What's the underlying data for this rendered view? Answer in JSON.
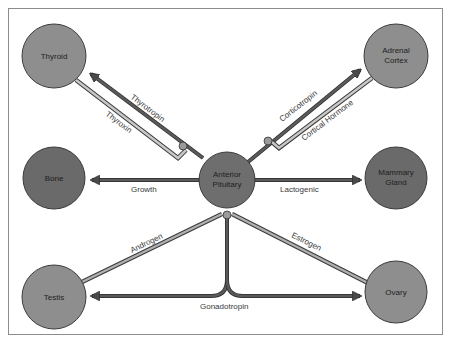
{
  "diagram": {
    "colors": {
      "frame": "#8c8c8c",
      "node_light": "#8e8e8e",
      "node_dark": "#6a6a6a",
      "node_stroke": "#3c3c3c",
      "arrow_dark": "#4a4a4a",
      "arrow_light": "#9a9a9a"
    },
    "nodes": {
      "center": {
        "line1": "Anterior",
        "line2": "Pituitary"
      },
      "thyroid": {
        "line1": "Thyroid"
      },
      "adrenal": {
        "line1": "Adrenal",
        "line2": "Cortex"
      },
      "bone": {
        "line1": "Bone"
      },
      "mammary": {
        "line1": "Mammary",
        "line2": "Gland"
      },
      "testis": {
        "line1": "Testis"
      },
      "ovary": {
        "line1": "Ovary"
      }
    },
    "edges": {
      "thyrotropin": "Thyrotropin",
      "thyroxin": "Thyroxin",
      "corticotropin": "Corticotropin",
      "cortical_hormone": "Cortical Hormone",
      "growth": "Growth",
      "lactogenic": "Lactogenic",
      "androgen": "Androgen",
      "estrogen": "Estrogen",
      "gonadotropin": "Gonadotropin"
    }
  }
}
